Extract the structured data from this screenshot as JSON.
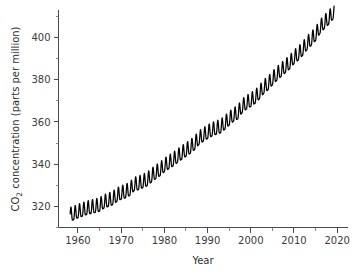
{
  "chart_data": {
    "type": "line",
    "title": "",
    "xlabel": "Year",
    "ylabel": "CO2 concentration (parts per million)",
    "ylabel_prefix": "CO",
    "ylabel_subscript": "2",
    "ylabel_suffix": " concentration (parts per million)",
    "xlim": [
      1955.5,
      2022.5
    ],
    "ylim": [
      310,
      413
    ],
    "grid": false,
    "legend": null,
    "xticks": [
      1960,
      1970,
      1980,
      1990,
      2000,
      2010,
      2020
    ],
    "xticklabels": [
      "1960",
      "1970",
      "1980",
      "1990",
      "2000",
      "2010",
      "2020"
    ],
    "xminor_step": 5,
    "yticks": [
      320,
      340,
      360,
      380,
      400
    ],
    "yticklabels": [
      "320",
      "340",
      "360",
      "380",
      "400"
    ],
    "yminor_step": 10,
    "line_color": "#000000",
    "axis_color": "#4a4a4a",
    "background_color": "#ffffff",
    "series": [
      {
        "name": "Monthly mean CO2 (Mauna Loa)",
        "description": "Keeling Curve: monthly atmospheric CO2 with annual seasonal cycle superimposed on a rising trend",
        "seasonal_amplitude_ppm": 3.2,
        "x_start": 1958.2,
        "x_end": 2019.3,
        "annual_trend_x": [
          1958,
          1959,
          1960,
          1961,
          1962,
          1963,
          1964,
          1965,
          1966,
          1967,
          1968,
          1969,
          1970,
          1971,
          1972,
          1973,
          1974,
          1975,
          1976,
          1977,
          1978,
          1979,
          1980,
          1981,
          1982,
          1983,
          1984,
          1985,
          1986,
          1987,
          1988,
          1989,
          1990,
          1991,
          1992,
          1993,
          1994,
          1995,
          1996,
          1997,
          1998,
          1999,
          2000,
          2001,
          2002,
          2003,
          2004,
          2005,
          2006,
          2007,
          2008,
          2009,
          2010,
          2011,
          2012,
          2013,
          2014,
          2015,
          2016,
          2017,
          2018,
          2019
        ],
        "annual_trend_y": [
          315.3,
          315.9,
          316.9,
          317.6,
          318.4,
          318.9,
          319.4,
          320.0,
          321.4,
          322.2,
          323.0,
          324.6,
          325.7,
          326.3,
          327.5,
          329.7,
          330.2,
          331.1,
          332.0,
          333.8,
          335.4,
          336.8,
          338.7,
          340.1,
          341.4,
          343.0,
          344.6,
          346.0,
          347.4,
          349.2,
          351.6,
          353.1,
          354.4,
          355.6,
          356.4,
          357.1,
          358.8,
          360.8,
          362.6,
          363.7,
          366.7,
          368.4,
          369.6,
          371.1,
          373.2,
          375.8,
          377.5,
          379.8,
          381.9,
          383.8,
          385.6,
          387.4,
          389.9,
          391.6,
          393.8,
          396.5,
          398.6,
          400.8,
          404.2,
          406.5,
          408.5,
          411.0
        ]
      }
    ]
  }
}
